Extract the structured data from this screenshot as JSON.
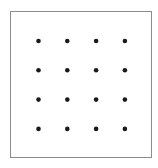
{
  "diagram": {
    "type": "dot-grid",
    "rows": 4,
    "columns": 4,
    "dot_count": 16,
    "dot_color": "#1a1a1a",
    "border_color": "#8c8c8c"
  }
}
